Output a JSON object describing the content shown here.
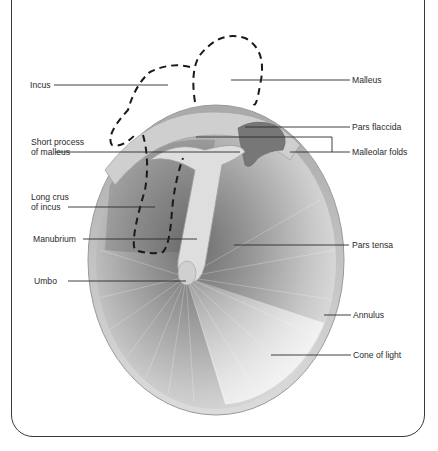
{
  "diagram": {
    "labels_left": [
      {
        "id": "incus",
        "text": "Incus"
      },
      {
        "id": "short-process",
        "line1": "Short process",
        "line2": "of malleus"
      },
      {
        "id": "long-crus",
        "line1": "Long crus",
        "line2": "of incus"
      },
      {
        "id": "manubrium",
        "text": "Manubrium"
      },
      {
        "id": "umbo",
        "text": "Umbo"
      }
    ],
    "labels_right": [
      {
        "id": "malleus",
        "text": "Malleus"
      },
      {
        "id": "pars-flaccida",
        "text": "Pars flaccida"
      },
      {
        "id": "malleolar-folds",
        "text": "Malleolar folds"
      },
      {
        "id": "pars-tensa",
        "text": "Pars tensa"
      },
      {
        "id": "annulus",
        "text": "Annulus"
      },
      {
        "id": "cone-of-light",
        "text": "Cone of light"
      }
    ],
    "colors": {
      "frame": "#3a3a3a",
      "leader": "#2a2a2a",
      "dashed_outline": "#1a1a1a",
      "membrane_dark": "#7a7a7a",
      "membrane_light": "#f2f2f2"
    }
  }
}
